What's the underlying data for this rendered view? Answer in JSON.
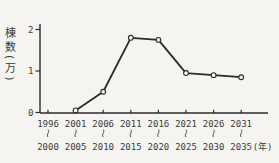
{
  "chart_data": {
    "type": "line",
    "title": "",
    "ylabel": "棟数(万)",
    "x_unit_label": "(年)",
    "y_ticks": [
      0,
      1,
      2
    ],
    "ylim": [
      0,
      2.2
    ],
    "categories": [
      {
        "from": "1996",
        "to": "2000"
      },
      {
        "from": "2001",
        "to": "2005"
      },
      {
        "from": "2006",
        "to": "2010"
      },
      {
        "from": "2011",
        "to": "2015"
      },
      {
        "from": "2016",
        "to": "2020"
      },
      {
        "from": "2021",
        "to": "2025"
      },
      {
        "from": "2026",
        "to": "2030"
      },
      {
        "from": "2031",
        "to": "2035"
      }
    ],
    "range_separator": "〜",
    "values": [
      null,
      0.05,
      0.5,
      1.8,
      1.75,
      0.95,
      0.9,
      0.85
    ],
    "marker": "open-circle",
    "line_color": "#2b2b2b",
    "text_color": "#3b3b3b",
    "background": "#f5f4f1",
    "grid": false,
    "legend": "none"
  }
}
